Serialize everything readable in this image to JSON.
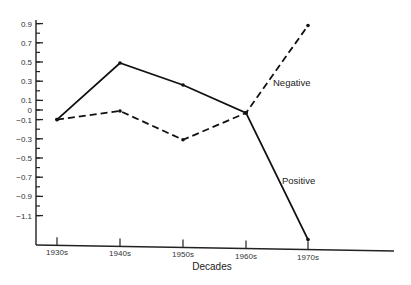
{
  "chart_data": {
    "type": "line",
    "title": "",
    "xlabel": "Decades",
    "ylabel": "",
    "categories": [
      "1930s",
      "1940s",
      "1950s",
      "1960s",
      "1970s"
    ],
    "series": [
      {
        "name": "Positive",
        "style": "solid",
        "values": [
          -0.1,
          0.49,
          0.26,
          -0.03,
          -1.35
        ]
      },
      {
        "name": "Negative",
        "style": "dashed",
        "values": [
          -0.1,
          -0.01,
          -0.31,
          -0.03,
          0.88
        ]
      }
    ],
    "yticks": [
      0.9,
      0.7,
      0.5,
      0.3,
      0.1,
      0,
      -0.1,
      -0.3,
      -0.5,
      -0.7,
      -0.9,
      -1.1
    ],
    "ytick_labels": [
      "0.9",
      "0.7",
      "0.5",
      "0.3",
      "0.1",
      "0",
      "−0.1",
      "−0.3",
      "−0.5",
      "−0.7",
      "−0.9",
      "−1.1"
    ],
    "ylim": [
      -1.35,
      0.95
    ],
    "grid": false,
    "legend": "inline labels next to lines",
    "colors": {
      "line": "#111111",
      "axis": "#222222",
      "background": "#ffffff"
    }
  }
}
